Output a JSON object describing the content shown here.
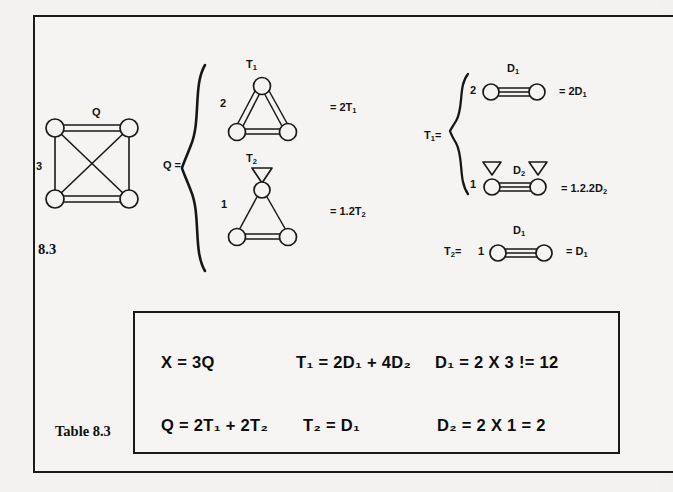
{
  "page": {
    "background_color": "#f3f2f0",
    "ink_color": "#141414"
  },
  "figure": {
    "caption": "8.3",
    "graph": {
      "name": "complete-graph-k4",
      "top_edge_label": "Q",
      "left_side_label": "3",
      "nodes": 4,
      "double_edges": [
        "top",
        "bottom"
      ],
      "single_edges": [
        "left",
        "right",
        "diagonal-1",
        "diagonal-2"
      ]
    }
  },
  "decomposition_q": {
    "lhs": "Q =",
    "items": [
      {
        "multiplicity": "2",
        "shape_label": "T",
        "shape_sub": "1",
        "result": "= 2T",
        "result_sub": "1",
        "edges": "three-double"
      },
      {
        "multiplicity": "1",
        "shape_label": "T",
        "shape_sub": "2",
        "result": "= 1.2T",
        "result_sub": "2",
        "edges": "two-single-one-double",
        "has_apex_arrow": true
      }
    ]
  },
  "decomposition_t1": {
    "lhs": "T",
    "lhs_sub": "1",
    "lhs_eq": "=",
    "items": [
      {
        "multiplicity": "2",
        "shape_label": "D",
        "shape_sub": "1",
        "result": "= 2D",
        "result_sub": "1",
        "arrows": 0
      },
      {
        "multiplicity": "1",
        "shape_label": "D",
        "shape_sub": "2",
        "result": "= 1.2.2D",
        "result_sub": "2",
        "arrows": 2
      }
    ]
  },
  "decomposition_t2": {
    "lhs": "T",
    "lhs_sub": "2",
    "lhs_eq": "=",
    "multiplicity": "1",
    "shape_label": "D",
    "shape_sub": "1",
    "result": "= D",
    "result_sub": "1"
  },
  "table": {
    "caption": "Table 8.3",
    "equations": [
      {
        "id": "eq-x",
        "html": "X = 3Q"
      },
      {
        "id": "eq-t1",
        "html": "T₁ = 2D₁ + 4D₂"
      },
      {
        "id": "eq-d1",
        "html": "D₁ = 2 X 3 != 12"
      },
      {
        "id": "eq-q",
        "html": "Q = 2T₁ + 2T₂"
      },
      {
        "id": "eq-t2",
        "html": "T₂ = D₁"
      },
      {
        "id": "eq-d2",
        "html": "D₂ = 2 X 1  =  2"
      }
    ],
    "row1": {
      "col1": "X = 3Q",
      "col2": "T₁ = 2D₁ + 4D₂",
      "col3": "D₁ = 2 X 3 != 12"
    },
    "row2": {
      "col1": "Q = 2T₁ + 2T₂",
      "col2": "T₂ = D₁",
      "col3": "D₂ = 2 X 1  =  2"
    }
  }
}
